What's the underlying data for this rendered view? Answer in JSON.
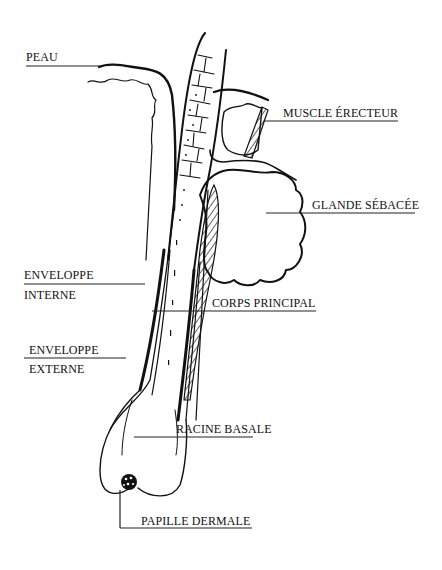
{
  "diagram": {
    "labels": {
      "peau": "PEAU",
      "muscle": "MUSCLE ÉRECTEUR",
      "glande": "GLANDE SÉBACÉE",
      "env_int_1": "ENVELOPPE",
      "env_int_2": "INTERNE",
      "corps": "CORPS PRINCIPAL",
      "env_ext_1": "ENVELOPPE",
      "env_ext_2": "EXTERNE",
      "racine": "RACINE BASALE",
      "papille": "PAPILLE DERMALE"
    },
    "colors": {
      "ink": "#111111",
      "background": "#ffffff"
    }
  }
}
